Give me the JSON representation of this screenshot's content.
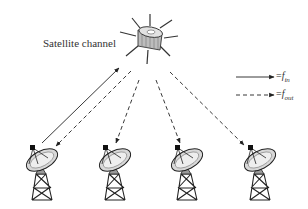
{
  "diagram": {
    "title_label": "Satellite channel",
    "satellite": {
      "name": "satellite",
      "center": [
        150,
        38
      ]
    },
    "ground_stations": [
      {
        "name": "ground-station-1",
        "x": 30
      },
      {
        "name": "ground-station-2",
        "x": 103
      },
      {
        "name": "ground-station-3",
        "x": 174
      },
      {
        "name": "ground-station-4",
        "x": 247
      }
    ],
    "links": [
      {
        "type": "uplink",
        "style": "solid",
        "from": "ground-station-1",
        "to": "satellite"
      },
      {
        "type": "downlink",
        "style": "dashed",
        "from": "satellite",
        "to": "ground-station-1"
      },
      {
        "type": "downlink",
        "style": "dashed",
        "from": "satellite",
        "to": "ground-station-2"
      },
      {
        "type": "downlink",
        "style": "dashed",
        "from": "satellite",
        "to": "ground-station-3"
      },
      {
        "type": "downlink",
        "style": "dashed",
        "from": "satellite",
        "to": "ground-station-4"
      }
    ],
    "legend": [
      {
        "style": "solid",
        "eq": "=",
        "symbol": "f",
        "subscript": "in"
      },
      {
        "style": "dashed",
        "eq": "=",
        "symbol": "f",
        "subscript": "out"
      }
    ],
    "colors": {
      "line": "#333333",
      "dish_fill": "#d8d8d8",
      "satellite_body": "#bdbdbd"
    }
  }
}
